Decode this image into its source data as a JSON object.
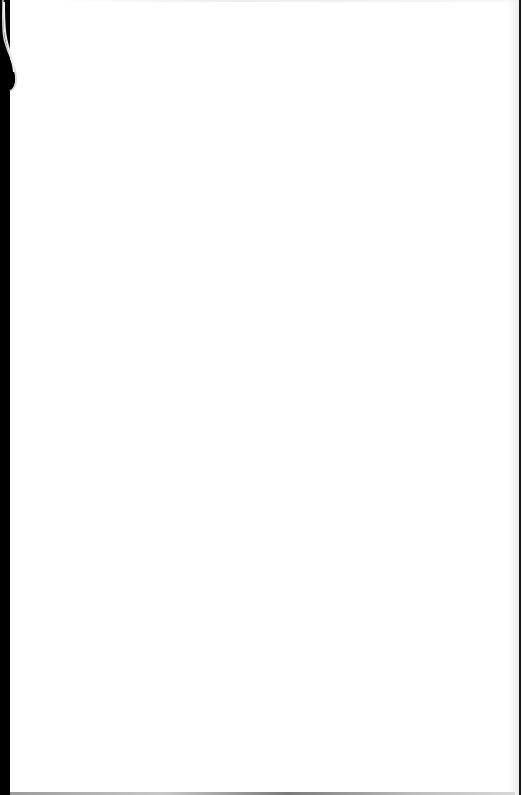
{
  "document": {
    "type": "scanned-page",
    "content": "",
    "is_blank": true
  },
  "colors": {
    "page": "#ffffff",
    "binding_edge": "#000000",
    "right_edge": "#1a1a1a"
  }
}
